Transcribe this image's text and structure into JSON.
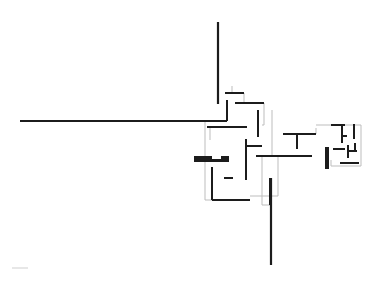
{
  "diagram": {
    "type": "architectural floor plan",
    "colors": {
      "background": "#ffffff",
      "wall": "#1c1c1c",
      "outline": "#bdbdbd"
    },
    "walls": [
      {
        "id": "north-wall",
        "x1": 218,
        "y1": 22,
        "x2": 218,
        "y2": 104,
        "w": 2.2
      },
      {
        "id": "west-wall",
        "x1": 20,
        "y1": 121,
        "x2": 210,
        "y2": 121,
        "w": 2.2
      },
      {
        "id": "south-wall",
        "x1": 271,
        "y1": 178,
        "x2": 271,
        "y2": 265,
        "w": 2.2
      },
      {
        "id": "w1",
        "x1": 225,
        "y1": 93,
        "x2": 244,
        "y2": 93,
        "w": 2
      },
      {
        "id": "w2",
        "x1": 235,
        "y1": 103,
        "x2": 264,
        "y2": 103,
        "w": 2
      },
      {
        "id": "w3",
        "x1": 227,
        "y1": 100,
        "x2": 227,
        "y2": 121,
        "w": 2
      },
      {
        "id": "w4",
        "x1": 210,
        "y1": 121,
        "x2": 227,
        "y2": 121,
        "w": 2
      },
      {
        "id": "w5",
        "x1": 207,
        "y1": 127,
        "x2": 247,
        "y2": 127,
        "w": 2
      },
      {
        "id": "w6",
        "x1": 258,
        "y1": 110,
        "x2": 258,
        "y2": 137,
        "w": 2
      },
      {
        "id": "w7",
        "x1": 246,
        "y1": 139,
        "x2": 246,
        "y2": 180,
        "w": 2
      },
      {
        "id": "w8",
        "x1": 246,
        "y1": 146,
        "x2": 262,
        "y2": 146,
        "w": 2
      },
      {
        "id": "w9",
        "x1": 256,
        "y1": 156,
        "x2": 300,
        "y2": 156,
        "w": 2
      },
      {
        "id": "w10",
        "x1": 212,
        "y1": 167,
        "x2": 212,
        "y2": 200,
        "w": 2
      },
      {
        "id": "w11",
        "x1": 212,
        "y1": 200,
        "x2": 250,
        "y2": 200,
        "w": 2
      },
      {
        "id": "w12",
        "x1": 224,
        "y1": 178,
        "x2": 233,
        "y2": 178,
        "w": 2
      },
      {
        "id": "w13",
        "x1": 270,
        "y1": 178,
        "x2": 270,
        "y2": 205,
        "w": 2
      },
      {
        "id": "w14",
        "x1": 283,
        "y1": 134,
        "x2": 316,
        "y2": 134,
        "w": 2
      },
      {
        "id": "w15",
        "x1": 297,
        "y1": 134,
        "x2": 297,
        "y2": 149,
        "w": 2
      },
      {
        "id": "w16",
        "x1": 256,
        "y1": 156,
        "x2": 312,
        "y2": 156,
        "w": 2
      },
      {
        "id": "w17",
        "x1": 331,
        "y1": 125,
        "x2": 345,
        "y2": 125,
        "w": 2
      },
      {
        "id": "w18",
        "x1": 342,
        "y1": 125,
        "x2": 342,
        "y2": 143,
        "w": 2
      },
      {
        "id": "w19",
        "x1": 342,
        "y1": 136,
        "x2": 347,
        "y2": 136,
        "w": 2
      },
      {
        "id": "w20",
        "x1": 354,
        "y1": 124,
        "x2": 354,
        "y2": 139,
        "w": 2
      },
      {
        "id": "w21",
        "x1": 333,
        "y1": 149,
        "x2": 345,
        "y2": 149,
        "w": 2
      },
      {
        "id": "w22",
        "x1": 348,
        "y1": 145,
        "x2": 348,
        "y2": 158,
        "w": 2
      },
      {
        "id": "w23",
        "x1": 348,
        "y1": 151,
        "x2": 357,
        "y2": 151,
        "w": 2
      },
      {
        "id": "w24",
        "x1": 355,
        "y1": 143,
        "x2": 355,
        "y2": 151,
        "w": 2
      },
      {
        "id": "w25",
        "x1": 340,
        "y1": 163,
        "x2": 359,
        "y2": 163,
        "w": 2
      }
    ],
    "solid_blocks": [
      {
        "id": "fireplace-west",
        "x": 194,
        "y": 156,
        "w": 18,
        "h": 6
      },
      {
        "id": "fireplace-west-b",
        "x": 221,
        "y": 156,
        "w": 8,
        "h": 6
      },
      {
        "id": "fireplace-west-bar",
        "x": 194,
        "y": 159,
        "w": 35,
        "h": 3
      },
      {
        "id": "fireplace-east",
        "x": 325,
        "y": 147,
        "w": 4,
        "h": 22
      }
    ],
    "outlines": [
      {
        "id": "o1",
        "points": "205,121 205,200 212,200"
      },
      {
        "id": "o2",
        "points": "232,86 232,93"
      },
      {
        "id": "o3",
        "points": "244,93 244,103"
      },
      {
        "id": "o4",
        "points": "264,103 264,125 262,125"
      },
      {
        "id": "o5",
        "points": "272,110 272,157"
      },
      {
        "id": "o6",
        "points": "278,156 278,196 250,196"
      },
      {
        "id": "o7",
        "points": "262,155 262,205 270,205"
      },
      {
        "id": "o8",
        "points": "316,128 316,134"
      },
      {
        "id": "o9",
        "points": "316,125 361,125 361,166 331,166 331,160"
      },
      {
        "id": "o10",
        "points": "210,127 210,140"
      }
    ],
    "scale_bar": {
      "x1": 12,
      "y1": 268,
      "x2": 28,
      "y2": 268
    }
  }
}
